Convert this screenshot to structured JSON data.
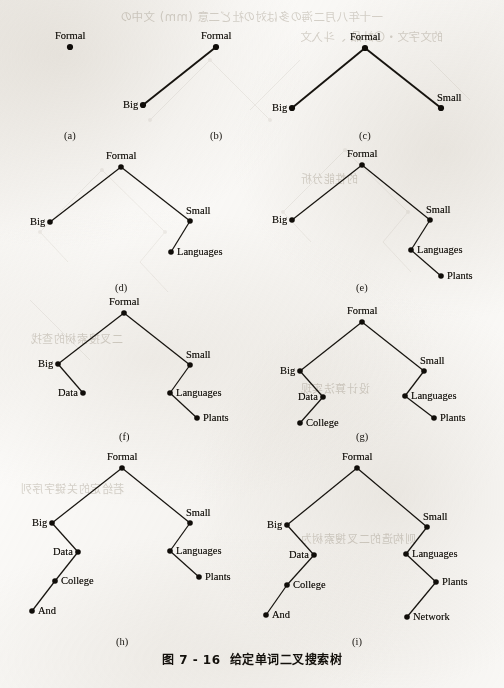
{
  "page": {
    "width": 504,
    "height": 688,
    "background_color": "#fbfaf8",
    "ink_color": "#15120d"
  },
  "figure": {
    "caption_number": "图 7 - 16",
    "caption_title": "给定单词二叉搜索树",
    "subcaptions": {
      "a": "(a)",
      "b": "(b)",
      "c": "(c)",
      "d": "(d)",
      "e": "(e)",
      "f": "(f)",
      "g": "(g)",
      "h": "(h)",
      "i": "(i)"
    }
  },
  "chart_data": {
    "type": "diagram",
    "diagram_kind": "binary-search-tree-insertion-sequence",
    "title": "给定单词二叉搜索树",
    "insertion_order": [
      "Formal",
      "Big",
      "Small",
      "Languages",
      "Plants",
      "Data",
      "College",
      "And",
      "Network"
    ],
    "panels": [
      {
        "id": "a",
        "label": "(a)",
        "inserted": "Formal",
        "nodes": [
          {
            "key": "Formal",
            "x": 70,
            "y": 47,
            "label": "Formal",
            "label_pos": "above"
          }
        ],
        "edges": []
      },
      {
        "id": "b",
        "label": "(b)",
        "inserted": "Big",
        "nodes": [
          {
            "key": "Formal",
            "x": 216,
            "y": 47,
            "label": "Formal",
            "label_pos": "above"
          },
          {
            "key": "Big",
            "x": 143,
            "y": 105,
            "label": "Big",
            "label_pos": "left"
          }
        ],
        "edges": [
          [
            "Formal",
            "Big"
          ]
        ]
      },
      {
        "id": "c",
        "label": "(c)",
        "inserted": "Small",
        "nodes": [
          {
            "key": "Formal",
            "x": 365,
            "y": 48,
            "label": "Formal",
            "label_pos": "above"
          },
          {
            "key": "Big",
            "x": 292,
            "y": 108,
            "label": "Big",
            "label_pos": "left"
          },
          {
            "key": "Small",
            "x": 441,
            "y": 108,
            "label": "Small",
            "label_pos": "above-right"
          }
        ],
        "edges": [
          [
            "Formal",
            "Big"
          ],
          [
            "Formal",
            "Small"
          ]
        ]
      },
      {
        "id": "d",
        "label": "(d)",
        "inserted": "Languages",
        "nodes": [
          {
            "key": "Formal",
            "x": 121,
            "y": 167,
            "label": "Formal",
            "label_pos": "above"
          },
          {
            "key": "Big",
            "x": 50,
            "y": 222,
            "label": "Big",
            "label_pos": "left"
          },
          {
            "key": "Small",
            "x": 190,
            "y": 221,
            "label": "Small",
            "label_pos": "above-right"
          },
          {
            "key": "Languages",
            "x": 171,
            "y": 252,
            "label": "Languages",
            "label_pos": "right"
          }
        ],
        "edges": [
          [
            "Formal",
            "Big"
          ],
          [
            "Formal",
            "Small"
          ],
          [
            "Small",
            "Languages"
          ]
        ]
      },
      {
        "id": "e",
        "label": "(e)",
        "inserted": "Plants",
        "nodes": [
          {
            "key": "Formal",
            "x": 362,
            "y": 165,
            "label": "Formal",
            "label_pos": "above"
          },
          {
            "key": "Big",
            "x": 292,
            "y": 220,
            "label": "Big",
            "label_pos": "left"
          },
          {
            "key": "Small",
            "x": 430,
            "y": 220,
            "label": "Small",
            "label_pos": "above-right"
          },
          {
            "key": "Languages",
            "x": 411,
            "y": 250,
            "label": "Languages",
            "label_pos": "right"
          },
          {
            "key": "Plants",
            "x": 441,
            "y": 276,
            "label": "Plants",
            "label_pos": "right"
          }
        ],
        "edges": [
          [
            "Formal",
            "Big"
          ],
          [
            "Formal",
            "Small"
          ],
          [
            "Small",
            "Languages"
          ],
          [
            "Languages",
            "Plants"
          ]
        ]
      },
      {
        "id": "f",
        "label": "(f)",
        "inserted": "Data",
        "nodes": [
          {
            "key": "Formal",
            "x": 124,
            "y": 313,
            "label": "Formal",
            "label_pos": "above"
          },
          {
            "key": "Big",
            "x": 58,
            "y": 364,
            "label": "Big",
            "label_pos": "left"
          },
          {
            "key": "Small",
            "x": 190,
            "y": 365,
            "label": "Small",
            "label_pos": "above-right"
          },
          {
            "key": "Data",
            "x": 83,
            "y": 393,
            "label": "Data",
            "label_pos": "left"
          },
          {
            "key": "Languages",
            "x": 170,
            "y": 393,
            "label": "Languages",
            "label_pos": "right"
          },
          {
            "key": "Plants",
            "x": 197,
            "y": 418,
            "label": "Plants",
            "label_pos": "right"
          }
        ],
        "edges": [
          [
            "Formal",
            "Big"
          ],
          [
            "Formal",
            "Small"
          ],
          [
            "Big",
            "Data"
          ],
          [
            "Small",
            "Languages"
          ],
          [
            "Languages",
            "Plants"
          ]
        ]
      },
      {
        "id": "g",
        "label": "(g)",
        "inserted": "College",
        "nodes": [
          {
            "key": "Formal",
            "x": 362,
            "y": 322,
            "label": "Formal",
            "label_pos": "above"
          },
          {
            "key": "Big",
            "x": 300,
            "y": 371,
            "label": "Big",
            "label_pos": "left"
          },
          {
            "key": "Small",
            "x": 424,
            "y": 371,
            "label": "Small",
            "label_pos": "above-right"
          },
          {
            "key": "Data",
            "x": 323,
            "y": 397,
            "label": "Data",
            "label_pos": "left"
          },
          {
            "key": "Languages",
            "x": 405,
            "y": 396,
            "label": "Languages",
            "label_pos": "right"
          },
          {
            "key": "College",
            "x": 300,
            "y": 423,
            "label": "College",
            "label_pos": "right"
          },
          {
            "key": "Plants",
            "x": 434,
            "y": 418,
            "label": "Plants",
            "label_pos": "right"
          }
        ],
        "edges": [
          [
            "Formal",
            "Big"
          ],
          [
            "Formal",
            "Small"
          ],
          [
            "Big",
            "Data"
          ],
          [
            "Data",
            "College"
          ],
          [
            "Small",
            "Languages"
          ],
          [
            "Languages",
            "Plants"
          ]
        ]
      },
      {
        "id": "h",
        "label": "(h)",
        "inserted": "And",
        "nodes": [
          {
            "key": "Formal",
            "x": 122,
            "y": 468,
            "label": "Formal",
            "label_pos": "above"
          },
          {
            "key": "Big",
            "x": 52,
            "y": 523,
            "label": "Big",
            "label_pos": "left"
          },
          {
            "key": "Small",
            "x": 190,
            "y": 523,
            "label": "Small",
            "label_pos": "above-right"
          },
          {
            "key": "Data",
            "x": 78,
            "y": 552,
            "label": "Data",
            "label_pos": "left"
          },
          {
            "key": "Languages",
            "x": 170,
            "y": 551,
            "label": "Languages",
            "label_pos": "right"
          },
          {
            "key": "College",
            "x": 55,
            "y": 581,
            "label": "College",
            "label_pos": "right"
          },
          {
            "key": "Plants",
            "x": 199,
            "y": 577,
            "label": "Plants",
            "label_pos": "right"
          },
          {
            "key": "And",
            "x": 32,
            "y": 611,
            "label": "And",
            "label_pos": "right"
          }
        ],
        "edges": [
          [
            "Formal",
            "Big"
          ],
          [
            "Formal",
            "Small"
          ],
          [
            "Big",
            "Data"
          ],
          [
            "Data",
            "College"
          ],
          [
            "College",
            "And"
          ],
          [
            "Small",
            "Languages"
          ],
          [
            "Languages",
            "Plants"
          ]
        ]
      },
      {
        "id": "i",
        "label": "(i)",
        "inserted": "Network",
        "nodes": [
          {
            "key": "Formal",
            "x": 357,
            "y": 468,
            "label": "Formal",
            "label_pos": "above"
          },
          {
            "key": "Big",
            "x": 287,
            "y": 525,
            "label": "Big",
            "label_pos": "left"
          },
          {
            "key": "Small",
            "x": 427,
            "y": 527,
            "label": "Small",
            "label_pos": "above-right"
          },
          {
            "key": "Data",
            "x": 314,
            "y": 555,
            "label": "Data",
            "label_pos": "left"
          },
          {
            "key": "Languages",
            "x": 406,
            "y": 554,
            "label": "Languages",
            "label_pos": "right"
          },
          {
            "key": "College",
            "x": 287,
            "y": 585,
            "label": "College",
            "label_pos": "right"
          },
          {
            "key": "Plants",
            "x": 436,
            "y": 582,
            "label": "Plants",
            "label_pos": "right"
          },
          {
            "key": "And",
            "x": 266,
            "y": 615,
            "label": "And",
            "label_pos": "right"
          },
          {
            "key": "Network",
            "x": 407,
            "y": 617,
            "label": "Network",
            "label_pos": "right"
          }
        ],
        "edges": [
          [
            "Formal",
            "Big"
          ],
          [
            "Formal",
            "Small"
          ],
          [
            "Big",
            "Data"
          ],
          [
            "Data",
            "College"
          ],
          [
            "College",
            "And"
          ],
          [
            "Small",
            "Languages"
          ],
          [
            "Languages",
            "Plants"
          ],
          [
            "Plants",
            "Network"
          ]
        ]
      }
    ]
  },
  "bleed_through": [
    {
      "text": "一十年八月二海の多は対の社ど二意 (mm) 文中の",
      "x": 120,
      "y": 8,
      "size": 11.5,
      "cn": true
    },
    {
      "text": "的文字文・〇計品 、斗入文",
      "x": 300,
      "y": 28,
      "size": 11.5,
      "cn": true
    },
    {
      "text": "的性能分析",
      "x": 300,
      "y": 170,
      "size": 11,
      "cn": true
    },
    {
      "text": "二叉搜索树的查找",
      "x": 30,
      "y": 330,
      "size": 11,
      "cn": true
    },
    {
      "text": "设计算法实现",
      "x": 300,
      "y": 380,
      "size": 11,
      "cn": true
    },
    {
      "text": "若给定的关键字序列",
      "x": 20,
      "y": 480,
      "size": 11,
      "cn": true
    },
    {
      "text": "则构造的二叉搜索树为",
      "x": 300,
      "y": 530,
      "size": 11,
      "cn": true
    }
  ]
}
